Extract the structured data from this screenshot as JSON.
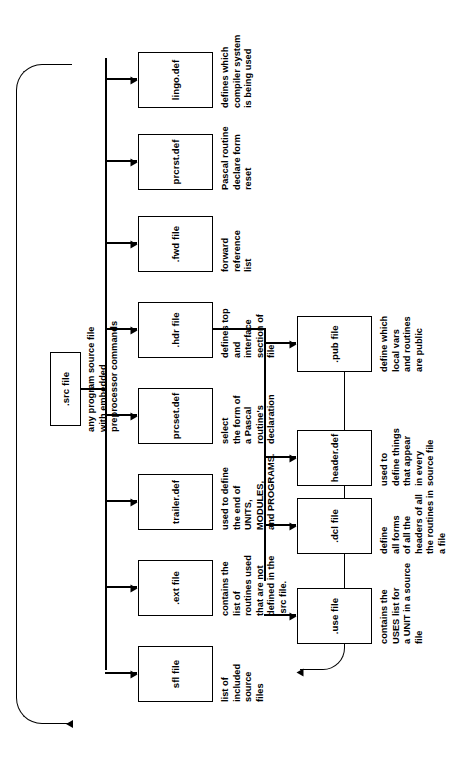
{
  "diagram": {
    "type": "flowchart",
    "orientation": "rotated-90-ccw",
    "colors": {
      "ink": "#000000",
      "paper": "#ffffff"
    },
    "root": {
      "id": "src",
      "label": ".src file",
      "caption": "any program source file\nwith embedded\npreprocessor commands"
    },
    "level1": [
      {
        "id": "lingo",
        "label": "lingo.def",
        "caption": "defines which\ncompiler system\nis being used"
      },
      {
        "id": "prcrst",
        "label": "prcrst.def",
        "caption": "Pascal routine\ndeclare form\nreset"
      },
      {
        "id": "fwd",
        "label": ".fwd file",
        "caption": "forward\nreference\nlist"
      },
      {
        "id": "hdr",
        "label": ".hdr file",
        "caption": "defines top\nand\ninterface\nsection of\nfile"
      },
      {
        "id": "prcset",
        "label": "prcset.def",
        "caption": "select\nthe form of\na Pascal\nroutine's\ndeclaration"
      },
      {
        "id": "trailer",
        "label": "trailer.def",
        "caption": "used to define\nthe end of\nUNITS,\nMODULES,\nand PROGRAMS."
      },
      {
        "id": "ext",
        "label": ".ext file",
        "caption": "contains the\nlist of\nroutines used\nthat are not\ndefined in the\n.src file."
      },
      {
        "id": "sfl",
        "label": "sfl file",
        "caption": "list of\nincluded\nsource\nfiles"
      }
    ],
    "level2": [
      {
        "id": "pub",
        "label": ".pub file",
        "caption": "define which\nlocal vars\nand routines\nare public"
      },
      {
        "id": "headerdef",
        "label": "header.def",
        "caption": "used to\ndefine things\nthat appear\nin every\nsource file"
      },
      {
        "id": "dcl",
        "label": ".dcl file",
        "caption": "define\nall forms\nof all the\nheaders of all\nthe routines in\na file"
      },
      {
        "id": "use",
        "label": ".use file",
        "caption": "contains the\nUSES list for\na UNIT in a source\nfile"
      }
    ],
    "feedback": [
      {
        "id": "sfl-to-src",
        "from": "sfl file",
        "to": ".src file"
      },
      {
        "id": "dcl-to-lingo",
        "from": ".dcl file",
        "to": "lingo.def"
      }
    ]
  }
}
